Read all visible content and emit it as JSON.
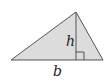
{
  "diagram": {
    "labels": {
      "height": "h",
      "base": "b"
    },
    "colors": {
      "fill": "#d9d9d9",
      "stroke": "#555555",
      "background": "#ffffff"
    },
    "vertices": {
      "left": [
        11,
        60
      ],
      "apex": [
        76,
        12
      ],
      "right": [
        103,
        60
      ]
    },
    "annotations": [
      "right-angle marker at foot of height"
    ]
  }
}
